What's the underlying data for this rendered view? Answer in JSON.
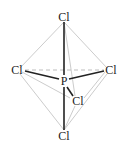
{
  "diagram": {
    "central_atom": {
      "label": "P",
      "x": 64,
      "y": 81
    },
    "ligands": [
      {
        "id": "top",
        "label": "Cl",
        "x": 64,
        "y": 17
      },
      {
        "id": "left",
        "label": "Cl",
        "x": 17,
        "y": 70
      },
      {
        "id": "right",
        "label": "Cl",
        "x": 111,
        "y": 70
      },
      {
        "id": "front",
        "label": "Cl",
        "x": 77,
        "y": 101
      },
      {
        "id": "bottom",
        "label": "Cl",
        "x": 64,
        "y": 136
      }
    ],
    "colors": {
      "bond": "#222222",
      "edge": "#c8c8c8",
      "dashed": "#bdbdbd"
    }
  }
}
